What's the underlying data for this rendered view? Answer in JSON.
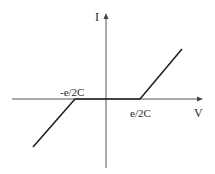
{
  "diagram": {
    "title": "",
    "axes": {
      "x_label": "V",
      "y_label": "I"
    },
    "tick_labels": {
      "negative_threshold": "-e/2C",
      "positive_threshold": "e/2C"
    },
    "colors": {
      "axis": "#555555",
      "curve": "#222222",
      "text": "#2a2a2a"
    }
  }
}
